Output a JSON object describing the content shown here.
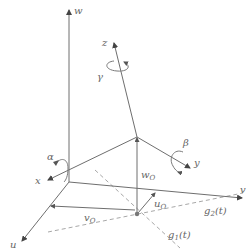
{
  "diagram": {
    "title": "",
    "axes_world": {
      "w": "w",
      "u": "u",
      "v": "v"
    },
    "axes_body": {
      "x": "x",
      "y": "y",
      "z": "z"
    },
    "rotations": {
      "alpha": "α",
      "beta": "β",
      "gamma": "γ"
    },
    "offsets": {
      "w_O": {
        "main": "w",
        "sub": "O"
      },
      "u_O": {
        "main": "u",
        "sub": "O"
      },
      "v_O": {
        "main": "v",
        "sub": "O"
      }
    },
    "curves": {
      "g1": {
        "main": "g",
        "sub": "1",
        "arg": "(t)"
      },
      "g2": {
        "main": "g",
        "sub": "2",
        "arg": "(t)"
      }
    },
    "colors": {
      "axis": "#6e6e6e",
      "dashed": "#a8a8a8",
      "text": "#666666",
      "background": "#ffffff"
    }
  }
}
